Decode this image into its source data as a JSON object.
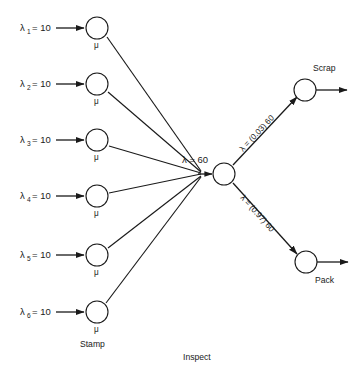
{
  "diagram": {
    "colors": {
      "ink": "#1a1a1a",
      "background": "#ffffff"
    },
    "stamp_stage": {
      "caption": "Stamp",
      "service_symbol": "μ",
      "nodes": [
        {
          "id": "stamp-1",
          "arrival_label": "λ",
          "subscript": "1",
          "equals": "= 10",
          "rate": 10,
          "cx": 97,
          "cy": 28
        },
        {
          "id": "stamp-2",
          "arrival_label": "λ",
          "subscript": "2",
          "equals": "= 10",
          "rate": 10,
          "cx": 97,
          "cy": 84
        },
        {
          "id": "stamp-3",
          "arrival_label": "λ",
          "subscript": "3",
          "equals": "= 10",
          "rate": 10,
          "cx": 97,
          "cy": 140
        },
        {
          "id": "stamp-4",
          "arrival_label": "λ",
          "subscript": "4",
          "equals": "= 10",
          "rate": 10,
          "cx": 97,
          "cy": 196
        },
        {
          "id": "stamp-5",
          "arrival_label": "λ",
          "subscript": "5",
          "equals": "= 10",
          "rate": 10,
          "cx": 97,
          "cy": 255
        },
        {
          "id": "stamp-6",
          "arrival_label": "λ",
          "subscript": "6",
          "equals": "= 10",
          "rate": 10,
          "cx": 97,
          "cy": 312
        }
      ]
    },
    "inspect_stage": {
      "caption": "Inspect",
      "combined_rate_label": "λ = 60",
      "combined_rate": 60,
      "cx": 224,
      "cy": 174
    },
    "branches": [
      {
        "id": "scrap-branch",
        "label": "λ = (0.03) 60",
        "probability": 0.03,
        "base_rate": 60,
        "effective_rate": 1.8,
        "target": "Scrap"
      },
      {
        "id": "pack-branch",
        "label": "λ = (0.97) 60",
        "probability": 0.97,
        "base_rate": 60,
        "effective_rate": 58.2,
        "target": "Pack"
      }
    ],
    "outputs": [
      {
        "id": "scrap-node",
        "label": "Scrap",
        "cx": 305,
        "cy": 90
      },
      {
        "id": "pack-node",
        "label": "Pack",
        "cx": 306,
        "cy": 262
      }
    ]
  }
}
